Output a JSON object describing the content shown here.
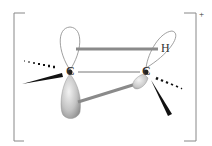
{
  "diagram": {
    "type": "molecular-orbital-structure",
    "charge_label": "+",
    "atoms": [
      {
        "id": "c1",
        "label": "C",
        "x": 70,
        "y": 72
      },
      {
        "id": "c2",
        "label": "C",
        "x": 146,
        "y": 72
      },
      {
        "id": "h",
        "label": "H",
        "x": 166,
        "y": 48
      }
    ],
    "colors": {
      "bracket": "#888888",
      "orbital_outline": "#777777",
      "bond_grey": "#8a8a8a",
      "wedge": "#111111",
      "lobe_fill": "#c8c8c8"
    }
  }
}
